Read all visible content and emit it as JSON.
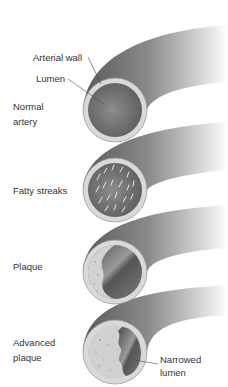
{
  "diagram": {
    "colors": {
      "background": "#ffffff",
      "wall_ring": "#d9d9d9",
      "tube_dark": "#5e5e5e",
      "tube_light": "#ffffff",
      "lumen": "#7a7a7a",
      "plaque": "#cfcfcf",
      "text": "#333333",
      "leader_line": "#444444"
    },
    "stages": [
      {
        "id": "normal",
        "label_lines": [
          "Normal",
          "artery"
        ]
      },
      {
        "id": "fatty-streaks",
        "label_lines": [
          "Fatty streaks"
        ]
      },
      {
        "id": "plaque",
        "label_lines": [
          "Plaque"
        ]
      },
      {
        "id": "advanced-plaque",
        "label_lines": [
          "Advanced",
          "plaque"
        ]
      }
    ],
    "callouts": {
      "arterial_wall": "Arterial wall",
      "lumen": "Lumen",
      "narrowed_lumen_lines": [
        "Narrowed",
        "lumen"
      ]
    }
  }
}
